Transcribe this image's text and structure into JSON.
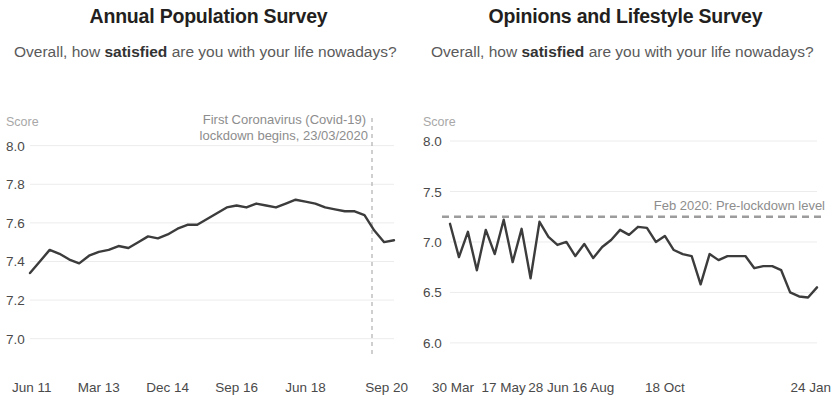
{
  "panels": [
    {
      "title": "Annual Population Survey",
      "question_pre": "Overall, how ",
      "question_bold": "satisfied",
      "question_post": " are you with your life nowadays?",
      "score_label": "Score",
      "annotation_line1": "First Coronavirus (Covid-19)",
      "annotation_line2": "lockdown begins, 23/03/2020",
      "chart_data": {
        "type": "line",
        "title": "Annual Population Survey",
        "subtitle": "Overall, how satisfied are you with your life nowadays?",
        "xlabel": "",
        "ylabel": "Score",
        "ylim": [
          6.9,
          8.05
        ],
        "yticks": [
          8.0,
          7.8,
          7.6,
          7.4,
          7.2,
          7.0
        ],
        "ytick_labels": [
          "8.0",
          "7.8",
          "7.6",
          "7.4",
          "7.2",
          "7.0"
        ],
        "xtick_labels": [
          "Jun 11",
          "Mar 13",
          "Dec 14",
          "Sep 16",
          "Jun 18",
          "Sep 20"
        ],
        "xtick_positions": [
          0,
          7,
          14,
          21,
          28,
          37
        ],
        "grid": true,
        "legend": "none",
        "x": [
          0,
          1,
          2,
          3,
          4,
          5,
          6,
          7,
          8,
          9,
          10,
          11,
          12,
          13,
          14,
          15,
          16,
          17,
          18,
          19,
          20,
          21,
          22,
          23,
          24,
          25,
          26,
          27,
          28,
          29,
          30,
          31,
          32,
          33,
          34,
          35,
          36,
          37
        ],
        "values": [
          7.34,
          7.4,
          7.46,
          7.44,
          7.41,
          7.39,
          7.43,
          7.45,
          7.46,
          7.48,
          7.47,
          7.5,
          7.53,
          7.52,
          7.54,
          7.57,
          7.59,
          7.59,
          7.62,
          7.65,
          7.68,
          7.69,
          7.68,
          7.7,
          7.69,
          7.68,
          7.7,
          7.72,
          7.71,
          7.7,
          7.68,
          7.67,
          7.66,
          7.66,
          7.64,
          7.56,
          7.5,
          7.51
        ],
        "event_marker": {
          "label": "First Coronavirus (Covid-19) lockdown begins, 23/03/2020",
          "x_index": 35,
          "style": "vertical dashed line"
        }
      }
    },
    {
      "title": "Opinions and Lifestyle Survey",
      "question_pre": "Overall, how ",
      "question_bold": "satisfied",
      "question_post": " are you with your life nowadays?",
      "score_label": "Score",
      "reference_label": "Feb 2020: Pre-lockdown level",
      "chart_data": {
        "type": "line",
        "title": "Opinions and Lifestyle Survey",
        "subtitle": "Overall, how satisfied are you with your life nowadays?",
        "xlabel": "",
        "ylabel": "Score",
        "ylim": [
          5.85,
          8.05
        ],
        "yticks": [
          8.0,
          7.5,
          7.0,
          6.5,
          6.0
        ],
        "ytick_labels": [
          "8.0",
          "7.5",
          "7.0",
          "6.5",
          "6.0"
        ],
        "xtick_labels": [
          "30 Mar",
          "17 May",
          "28 Jun",
          "16 Aug",
          "18 Oct",
          "24 Jan"
        ],
        "xtick_positions": [
          0,
          6,
          11,
          16,
          24,
          41
        ],
        "grid": true,
        "legend": "none",
        "x": [
          0,
          1,
          2,
          3,
          4,
          5,
          6,
          7,
          8,
          9,
          10,
          11,
          12,
          13,
          14,
          15,
          16,
          17,
          18,
          19,
          20,
          21,
          22,
          23,
          24,
          25,
          26,
          27,
          28,
          29,
          30,
          31,
          32,
          33,
          34,
          35,
          36,
          37,
          38,
          39,
          40,
          41
        ],
        "values": [
          7.18,
          6.85,
          7.1,
          6.72,
          7.12,
          6.88,
          7.22,
          6.8,
          7.13,
          6.64,
          7.2,
          7.05,
          6.97,
          7.0,
          6.86,
          6.98,
          6.84,
          6.95,
          7.02,
          7.12,
          7.07,
          7.15,
          7.14,
          7.0,
          7.06,
          6.92,
          6.88,
          6.86,
          6.58,
          6.88,
          6.82,
          6.86,
          6.86,
          6.86,
          6.74,
          6.76,
          6.76,
          6.72,
          6.5,
          6.46,
          6.45,
          6.55
        ],
        "reference_line": {
          "label": "Feb 2020: Pre-lockdown level",
          "value": 7.25,
          "style": "horizontal dashed line"
        }
      }
    }
  ]
}
